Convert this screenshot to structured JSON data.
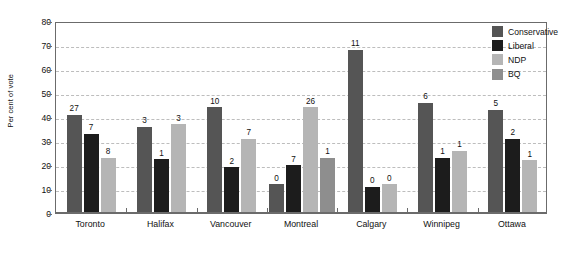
{
  "chart_data": {
    "type": "bar",
    "title": "",
    "xlabel": "",
    "ylabel": "Per cent of vote",
    "ylim": [
      0,
      80
    ],
    "ytick_values": [
      0,
      10,
      20,
      30,
      40,
      50,
      60,
      70,
      80
    ],
    "ytick_labels": [
      "0",
      "10",
      "20",
      "30",
      "40",
      "50",
      "60",
      "70",
      "80"
    ],
    "grid": true,
    "legend_position": "right",
    "categories": [
      "Toronto",
      "Halifax",
      "Vancouver",
      "Montreal",
      "Calgary",
      "Winnipeg",
      "Ottawa"
    ],
    "series": [
      {
        "name": "Conservative",
        "color": "#555555",
        "values": [
          41,
          36,
          44,
          12,
          68,
          46,
          43
        ],
        "point_labels": [
          "27",
          "3",
          "10",
          "0",
          "11",
          "6",
          "5"
        ]
      },
      {
        "name": "Liberal",
        "color": "#1c1c1c",
        "values": [
          33,
          22.5,
          19,
          20,
          11,
          23,
          31
        ],
        "point_labels": [
          "7",
          "1",
          "2",
          "7",
          "0",
          "1",
          "2"
        ]
      },
      {
        "name": "NDP",
        "color": "#b5b5b5",
        "values": [
          23,
          37,
          31,
          44,
          12,
          26,
          22
        ],
        "point_labels": [
          "8",
          "3",
          "7",
          "26",
          "0",
          "1",
          "1"
        ]
      },
      {
        "name": "BQ",
        "color": "#8e8e8e",
        "values": [
          null,
          null,
          null,
          23,
          null,
          null,
          null
        ],
        "point_labels": [
          null,
          null,
          null,
          "1",
          null,
          null,
          null
        ]
      }
    ]
  },
  "legend": {
    "items": [
      {
        "label": "Conservative",
        "color": "#555555"
      },
      {
        "label": "Liberal",
        "color": "#1c1c1c"
      },
      {
        "label": "NDP",
        "color": "#b5b5b5"
      },
      {
        "label": "BQ",
        "color": "#8e8e8e"
      }
    ]
  }
}
